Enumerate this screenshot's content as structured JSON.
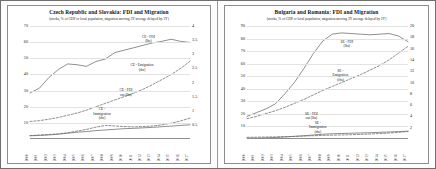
{
  "figure": {
    "panels": [
      {
        "key": "cze_svk",
        "title": "Czech Republic and Slovakia: FDI and Migration",
        "subtitle": "(stocks, % of GDP or local population, migration moving 3Y average delayed by 1Y)",
        "annotations": [
          {
            "name": "ce-fdi-label",
            "line1": "CE - FDI",
            "line2": "(lhs)",
            "x": 74,
            "y": 8
          },
          {
            "name": "ce-emigration-label",
            "line1": "CE - Emigration",
            "line2": "(rhs)",
            "x": 70,
            "y": 33
          },
          {
            "name": "ce-immigration-label",
            "line1": "CE -",
            "line2": "Immigration",
            "line3": "(rhs)",
            "x": 45,
            "y": 72
          },
          {
            "name": "ce-fdi-out-label",
            "line1": "CE - FDI",
            "line2": "out (lhs)",
            "x": 60,
            "y": 55
          }
        ]
      },
      {
        "key": "bgr_rou",
        "title": "Bulgaria and Romania: FDI and Migration",
        "subtitle": "(stocks, % of GDP or local population, migration moving 3Y average delayed by 1Y)",
        "annotations": [
          {
            "name": "se-fdi-label",
            "line1": "SE - FDI",
            "line2": "(lhs)",
            "x": 62,
            "y": 12
          },
          {
            "name": "se-emigration-label",
            "line1": "SE -",
            "line2": "Emigration",
            "line3": "(rhs)",
            "x": 58,
            "y": 38
          },
          {
            "name": "se-fdi-out-label",
            "line1": "SE - FDI",
            "line2": "out (lhs)",
            "x": 40,
            "y": 76
          },
          {
            "name": "se-immigration-label",
            "line1": "SE -",
            "line2": "Immigration",
            "line3": "(rhs)",
            "x": 44,
            "y": 84
          }
        ]
      }
    ]
  },
  "chart_data": [
    {
      "type": "line",
      "title": "Czech Republic and Slovakia: FDI and Migration",
      "subtitle": "(stocks, % of GDP or local population, migration moving 3Y average delayed by 1Y)",
      "xlabel": "",
      "ylabel": "",
      "x": [
        2000,
        2001,
        2002,
        2003,
        2004,
        2005,
        2006,
        2007,
        2008,
        2009,
        2010,
        2011,
        2012,
        2013,
        2014,
        2015,
        2016,
        2017
      ],
      "xtick_labels": [
        "2000",
        "2001",
        "2002",
        "2003",
        "2004",
        "2005",
        "2006",
        "2007",
        "2008",
        "2009",
        "2010",
        "2011",
        "2012",
        "2013",
        "2014",
        "2015",
        "2016",
        "2017"
      ],
      "ylim": [
        0,
        70
      ],
      "yticks": [
        10,
        20,
        30,
        40,
        50,
        60,
        70
      ],
      "y2lim": [
        0,
        4
      ],
      "y2ticks": [
        0.5,
        1,
        1.5,
        2,
        2.5,
        3,
        3.5,
        4
      ],
      "grid": true,
      "legend": "inline-annotations",
      "series": [
        {
          "name": "CE - FDI (lhs)",
          "axis": "left",
          "style": "solid",
          "color": "#6a6a6a",
          "values": [
            28.5,
            31.5,
            38.0,
            43.0,
            46.5,
            46.0,
            45.0,
            48.0,
            49.5,
            53.5,
            55.0,
            56.5,
            58.0,
            59.5,
            60.5,
            61.8,
            60.5,
            59.8
          ]
        },
        {
          "name": "CE - Emigration (rhs)",
          "axis": "right",
          "style": "dashed",
          "color": "#6a6a6a",
          "values": [
            0.62,
            0.65,
            0.7,
            0.76,
            0.84,
            0.92,
            1.02,
            1.14,
            1.26,
            1.38,
            1.5,
            1.62,
            1.76,
            1.92,
            2.1,
            2.28,
            2.5,
            2.75
          ]
        },
        {
          "name": "CE - FDI out (lhs)",
          "axis": "left",
          "style": "solid",
          "color": "#6a6a6a",
          "values": [
            2.0,
            2.2,
            2.5,
            3.0,
            3.6,
            4.2,
            4.6,
            5.2,
            5.6,
            6.0,
            6.4,
            6.6,
            6.9,
            7.2,
            7.6,
            8.0,
            8.4,
            8.8
          ]
        },
        {
          "name": "CE - Immigration (rhs)",
          "axis": "right",
          "style": "dashed",
          "color": "#6a6a6a",
          "values": [
            0.12,
            0.14,
            0.16,
            0.18,
            0.22,
            0.28,
            0.34,
            0.42,
            0.48,
            0.46,
            0.44,
            0.43,
            0.44,
            0.46,
            0.5,
            0.56,
            0.64,
            0.74
          ]
        }
      ]
    },
    {
      "type": "line",
      "title": "Bulgaria and Romania: FDI and Migration",
      "subtitle": "(stocks, % of GDP or local population, migration moving 3Y average delayed by 1Y)",
      "xlabel": "",
      "ylabel": "",
      "x": [
        2000,
        2001,
        2002,
        2003,
        2004,
        2005,
        2006,
        2007,
        2008,
        2009,
        2010,
        2011,
        2012,
        2013,
        2014,
        2015,
        2016,
        2017
      ],
      "xtick_labels": [
        "2000",
        "2001",
        "2002",
        "2003",
        "2004",
        "2005",
        "2006",
        "2007",
        "2008",
        "2009",
        "2010",
        "2011",
        "2012",
        "2013",
        "2014",
        "2015",
        "2016",
        "2017"
      ],
      "ylim": [
        0,
        90
      ],
      "yticks": [
        10,
        20,
        30,
        40,
        50,
        60,
        70,
        80,
        90
      ],
      "y2lim": [
        0,
        20
      ],
      "y2ticks": [
        2,
        4,
        6,
        8,
        10,
        12,
        14,
        16,
        18,
        20
      ],
      "grid": true,
      "legend": "inline-annotations",
      "series": [
        {
          "name": "SE - FDI (lhs)",
          "axis": "left",
          "style": "solid",
          "color": "#6a6a6a",
          "values": [
            18.0,
            21.0,
            24.0,
            28.0,
            36.0,
            45.0,
            56.0,
            68.0,
            78.0,
            83.5,
            84.5,
            84.0,
            83.5,
            83.0,
            83.5,
            84.0,
            82.0,
            77.5
          ]
        },
        {
          "name": "SE - Emigration (rhs)",
          "axis": "right",
          "style": "dashed",
          "color": "#6a6a6a",
          "values": [
            3.6,
            4.0,
            4.5,
            5.0,
            5.6,
            6.3,
            7.0,
            7.8,
            8.6,
            9.3,
            10.0,
            10.7,
            11.4,
            12.2,
            13.0,
            14.0,
            15.2,
            16.4
          ]
        },
        {
          "name": "SE - FDI out (lhs)",
          "axis": "left",
          "style": "solid",
          "color": "#6a6a6a",
          "values": [
            0.6,
            0.7,
            0.9,
            1.2,
            1.6,
            2.1,
            2.6,
            3.2,
            3.8,
            4.2,
            4.4,
            4.6,
            4.8,
            5.0,
            5.3,
            5.6,
            5.9,
            6.2
          ]
        },
        {
          "name": "SE - Immigration (rhs)",
          "axis": "right",
          "style": "dashed",
          "color": "#6a6a6a",
          "values": [
            0.3,
            0.32,
            0.35,
            0.38,
            0.42,
            0.46,
            0.52,
            0.58,
            0.64,
            0.68,
            0.72,
            0.76,
            0.82,
            0.88,
            0.96,
            1.06,
            1.18,
            1.32
          ]
        }
      ]
    }
  ]
}
